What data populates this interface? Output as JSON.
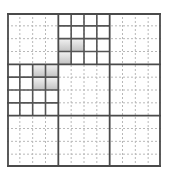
{
  "diagram": {
    "type": "block-grid",
    "rows": 12,
    "cols": 12,
    "block_size": 4,
    "highlighted_blocks": [
      {
        "block_row": 0,
        "block_col": 1
      },
      {
        "block_row": 1,
        "block_col": 0
      }
    ],
    "shaded_cells": [
      {
        "row": 2,
        "col": 4
      },
      {
        "row": 2,
        "col": 5
      },
      {
        "row": 3,
        "col": 4
      },
      {
        "row": 4,
        "col": 2
      },
      {
        "row": 4,
        "col": 3
      },
      {
        "row": 5,
        "col": 2
      },
      {
        "row": 5,
        "col": 3
      }
    ],
    "colors": {
      "major_line": "#4a4a4a",
      "block_line": "#555555",
      "minor_dashed_line": "#b8b8b8",
      "shade_top": "#f2f2f2",
      "shade_bottom": "#c2c2c2",
      "background": "#ffffff"
    }
  }
}
